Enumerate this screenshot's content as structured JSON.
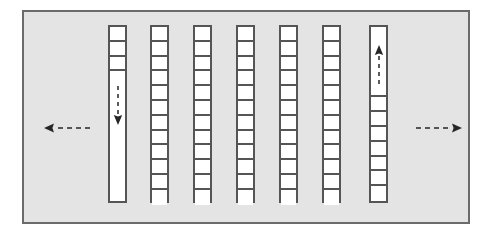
{
  "figure": {
    "background_color": "#ffffff",
    "panel_color": "#e4e4e4",
    "panel_border_color": "#6b6b6b",
    "cell_border_color": "#555555",
    "cell_fill_color": "#ffffff",
    "arrow_color": "#262626"
  },
  "panel": {
    "x": 22,
    "y": 10,
    "width": 448,
    "height": 214
  },
  "columns": [
    {
      "id": "column-1",
      "index": 1,
      "x": 108,
      "y": 25,
      "width": 19,
      "height": 178,
      "cell_count": 3,
      "cells_position": "top",
      "empty_space": "bottom",
      "arrow": "down",
      "arrow_style": "dashed",
      "arrow_label": ""
    },
    {
      "id": "column-2",
      "index": 2,
      "x": 150,
      "y": 25,
      "width": 19,
      "height": 178,
      "cell_count": 12,
      "cells_position": "full",
      "empty_space": "none",
      "arrow": "none",
      "arrow_style": "",
      "arrow_label": ""
    },
    {
      "id": "column-3",
      "index": 3,
      "x": 193,
      "y": 25,
      "width": 19,
      "height": 178,
      "cell_count": 12,
      "cells_position": "full",
      "empty_space": "none",
      "arrow": "none",
      "arrow_style": "",
      "arrow_label": ""
    },
    {
      "id": "column-4",
      "index": 4,
      "x": 236,
      "y": 25,
      "width": 19,
      "height": 178,
      "cell_count": 12,
      "cells_position": "full",
      "empty_space": "none",
      "arrow": "none",
      "arrow_style": "",
      "arrow_label": ""
    },
    {
      "id": "column-5",
      "index": 5,
      "x": 279,
      "y": 25,
      "width": 19,
      "height": 178,
      "cell_count": 12,
      "cells_position": "full",
      "empty_space": "none",
      "arrow": "none",
      "arrow_style": "",
      "arrow_label": ""
    },
    {
      "id": "column-6",
      "index": 6,
      "x": 322,
      "y": 25,
      "width": 19,
      "height": 178,
      "cell_count": 12,
      "cells_position": "full",
      "empty_space": "none",
      "arrow": "none",
      "arrow_style": "",
      "arrow_label": ""
    },
    {
      "id": "column-7",
      "index": 7,
      "x": 369,
      "y": 25,
      "width": 19,
      "height": 178,
      "cell_count": 7,
      "cells_position": "bottom",
      "empty_space": "top",
      "arrow": "up",
      "arrow_style": "dashed",
      "arrow_label": ""
    }
  ],
  "flow_arrows": [
    {
      "id": "arrow-left-out",
      "direction": "left",
      "style": "dashed",
      "x": 18,
      "y": 108,
      "length": 48,
      "label": ""
    },
    {
      "id": "arrow-right-out",
      "direction": "right",
      "style": "dashed",
      "x": 390,
      "y": 108,
      "length": 48,
      "label": ""
    }
  ]
}
